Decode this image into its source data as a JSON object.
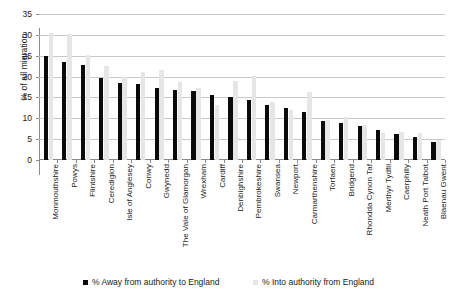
{
  "chart_data": {
    "type": "bar",
    "title": "",
    "subtitle": "",
    "xlabel": "",
    "ylabel": "% of all migration",
    "ylim": [
      0,
      35
    ],
    "ytick_step": 5,
    "yticks": [
      0,
      5,
      10,
      15,
      20,
      25,
      30,
      35
    ],
    "grid": true,
    "legend_position": "bottom",
    "categories": [
      "Monmouthshire",
      "Powys",
      "Flintshire",
      "Ceredigion",
      "Isle of Anglesey",
      "Conwy",
      "Gwynedd",
      "The Vale of Glamorgan",
      "Wrexham",
      "Cardiff",
      "Denbighshire",
      "Pembrokeshire",
      "Swansea",
      "Newport",
      "Carmarthenshire",
      "Torfaen",
      "Bridgend",
      "Rhondda Cynon Taf",
      "Merthyr Tydfil",
      "Caerphilly",
      "Neath Port Talbot",
      "Blaenau Gwent"
    ],
    "series": [
      {
        "name": "% Away from authority to England",
        "color": "#0a0a0a",
        "values": [
          25.0,
          23.6,
          22.7,
          19.7,
          18.5,
          18.3,
          17.3,
          16.9,
          16.6,
          15.6,
          15.0,
          14.4,
          13.2,
          12.4,
          11.6,
          9.3,
          8.9,
          8.2,
          7.1,
          6.2,
          5.6,
          4.3
        ]
      },
      {
        "name": "% Into authority from England",
        "color": "#e6e6e6",
        "values": [
          30.5,
          30.2,
          25.2,
          22.5,
          20.0,
          21.2,
          21.6,
          18.8,
          17.3,
          13.3,
          19.0,
          20.1,
          14.0,
          12.1,
          16.2,
          9.6,
          10.2,
          8.4,
          6.5,
          6.6,
          6.5,
          4.7
        ]
      }
    ]
  },
  "legend": {
    "items": [
      {
        "label": "% Away from authority to England",
        "color": "#0a0a0a"
      },
      {
        "label": "% Into authority from England",
        "color": "#e6e6e6"
      }
    ]
  }
}
